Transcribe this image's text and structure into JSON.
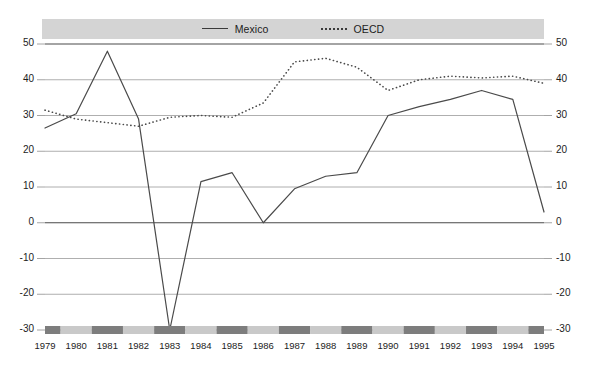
{
  "legend": {
    "items": [
      {
        "label": "Mexico",
        "style": "solid",
        "color": "#3a3a3a"
      },
      {
        "label": "OECD",
        "style": "dotted",
        "color": "#3a3a3a"
      }
    ]
  },
  "axes": {
    "y_ticks": [
      "50",
      "40",
      "30",
      "20",
      "10",
      "0",
      "-10",
      "-20",
      "-30"
    ],
    "y_ticks_right": [
      "50",
      "40",
      "30",
      "20",
      "10",
      "0",
      "-10",
      "-20",
      "-30"
    ],
    "x_ticks": [
      "1979",
      "1980",
      "1981",
      "1982",
      "1983",
      "1984",
      "1985",
      "1986",
      "1987",
      "1988",
      "1989",
      "1990",
      "1991",
      "1992",
      "1993",
      "1994",
      "1995"
    ]
  },
  "colors": {
    "grid": "#9a9a9a",
    "zero_line": "#4a4a4a",
    "line": "#4a4a4a",
    "legend_band": "#d4d4d4",
    "band_dark": "#7d7d7d",
    "band_light": "#c9c9c9"
  },
  "chart_data": {
    "type": "line",
    "title": "",
    "subtitle": "",
    "xlabel": "",
    "ylabel": "",
    "ylim": [
      -30,
      50
    ],
    "ytick_step": 10,
    "grid": true,
    "legend_position": "top-center",
    "x": [
      1979,
      1980,
      1981,
      1982,
      1983,
      1984,
      1985,
      1986,
      1987,
      1988,
      1989,
      1990,
      1991,
      1992,
      1993,
      1994,
      1995
    ],
    "categories": [
      "1979",
      "1980",
      "1981",
      "1982",
      "1983",
      "1984",
      "1985",
      "1986",
      "1987",
      "1988",
      "1989",
      "1990",
      "1991",
      "1992",
      "1993",
      "1994",
      "1995"
    ],
    "series": [
      {
        "name": "Mexico",
        "style": "solid",
        "values": [
          26.5,
          30.5,
          48.0,
          29.0,
          -30.0,
          11.5,
          14.0,
          0.0,
          9.5,
          13.0,
          14.0,
          30.0,
          32.5,
          34.5,
          37.0,
          34.5,
          3.0
        ]
      },
      {
        "name": "OECD",
        "style": "dotted",
        "values": [
          31.5,
          29.0,
          28.0,
          27.0,
          29.5,
          30.0,
          29.5,
          33.5,
          45.0,
          46.0,
          43.5,
          37.0,
          40.0,
          41.0,
          40.5,
          41.0,
          39.0
        ]
      }
    ]
  }
}
